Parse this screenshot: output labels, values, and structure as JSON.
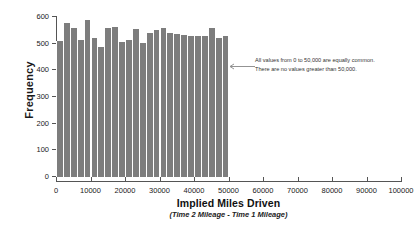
{
  "chart_data": {
    "type": "bar",
    "title": "",
    "xlabel": "Implied Miles Driven",
    "xsublabel": "(Time 2 Mileage - Time 1 Mileage)",
    "ylabel": "Frequency",
    "xlim": [
      0,
      100000
    ],
    "ylim": [
      0,
      600
    ],
    "grid": false,
    "legend": "none",
    "bar_color": "#7d7d7d",
    "bin_width": 2000,
    "xticks": [
      0,
      10000,
      20000,
      30000,
      40000,
      50000,
      60000,
      70000,
      80000,
      90000,
      100000
    ],
    "xtick_labels": [
      "0",
      "10000",
      "20000",
      "30000",
      "40000",
      "50000",
      "60000",
      "70000",
      "80000",
      "90000",
      "100000"
    ],
    "yticks": [
      0,
      100,
      200,
      300,
      400,
      500,
      600
    ],
    "ytick_labels": [
      "0",
      "100",
      "200",
      "300",
      "400",
      "500",
      "600"
    ],
    "bin_starts": [
      0,
      2000,
      4000,
      6000,
      8000,
      10000,
      12000,
      14000,
      16000,
      18000,
      20000,
      22000,
      24000,
      26000,
      28000,
      30000,
      32000,
      34000,
      36000,
      38000,
      40000,
      42000,
      44000,
      46000,
      48000
    ],
    "values": [
      510,
      578,
      560,
      515,
      588,
      523,
      487,
      558,
      562,
      508,
      512,
      555,
      502,
      540,
      550,
      558,
      540,
      535,
      532,
      530,
      528,
      530,
      558,
      520,
      527
    ],
    "annotations": [
      {
        "name": "no-values-above-50000",
        "lines": [
          "All values from 0 to 50,000 are equally common.",
          "There are no values greater than 50,000."
        ],
        "arrow": "left-arrow"
      }
    ]
  }
}
